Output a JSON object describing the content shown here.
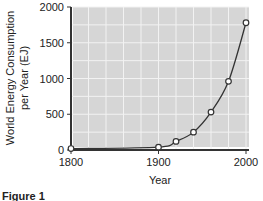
{
  "chart_data": {
    "type": "line",
    "title": "",
    "xlabel": "Year",
    "ylabel": "World Energy Consumption per Year (EJ)",
    "ylabel_lines": [
      "World Energy Consumption",
      "per Year (EJ)"
    ],
    "x": [
      1800,
      1900,
      1920,
      1940,
      1960,
      1980,
      2000
    ],
    "series": [
      {
        "name": "World Energy Consumption",
        "values": [
          20,
          40,
          120,
          250,
          530,
          960,
          1780
        ]
      }
    ],
    "xlim": [
      1800,
      2000
    ],
    "ylim": [
      0,
      2000
    ],
    "x_ticks": [
      "1800",
      "1900",
      "2000"
    ],
    "y_ticks": [
      "0",
      "500",
      "1000",
      "1500",
      "2000"
    ],
    "grid": true,
    "legend": "none"
  },
  "caption": "Figure 1",
  "colors": {
    "plot_bg": "#d6d6d6",
    "grid": "#f2f2f2",
    "line": "#333333"
  }
}
